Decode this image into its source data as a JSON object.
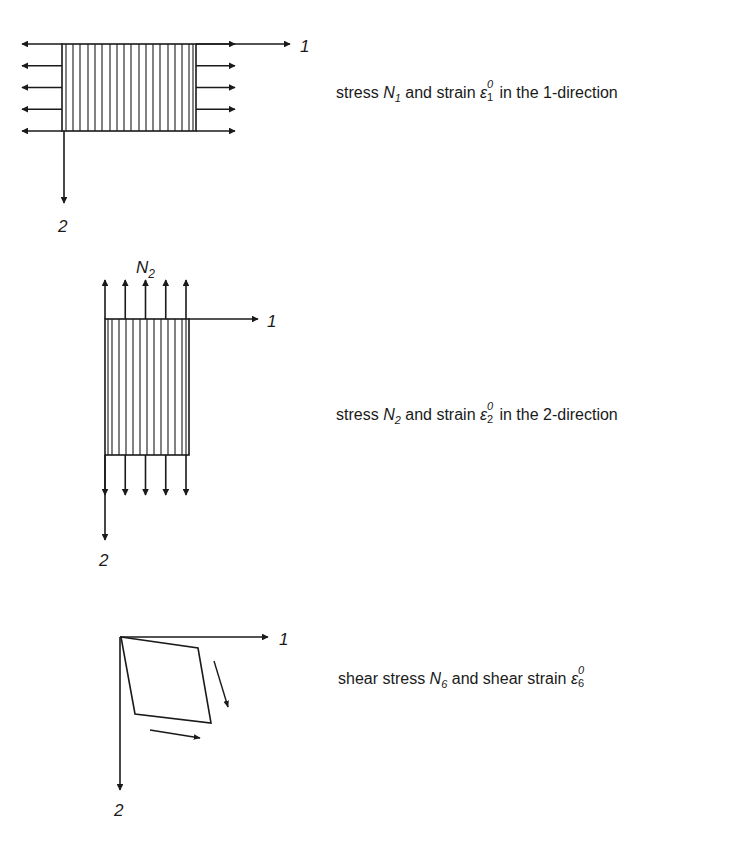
{
  "colors": {
    "ink": "#1a1a1a",
    "background": "#ffffff"
  },
  "panels": [
    {
      "id": "normal-1",
      "axis_labels": {
        "x": "1",
        "y": "2"
      },
      "hatch_direction": "vertical",
      "force_arrows": {
        "count_per_side": 5,
        "direction": "horizontal"
      },
      "caption": {
        "prefix": "stress ",
        "symbol": "N",
        "symbol_sub": "1",
        "middle": " and strain ",
        "strain_symbol": "ε",
        "strain_sup": "0",
        "strain_sub": "1",
        "suffix": " in the 1-direction"
      }
    },
    {
      "id": "normal-2",
      "axis_labels": {
        "x": "1",
        "y": "2"
      },
      "top_label": {
        "symbol": "N",
        "sub": "2"
      },
      "hatch_direction": "vertical",
      "force_arrows": {
        "count_per_side": 5,
        "direction": "vertical"
      },
      "caption": {
        "prefix": "stress ",
        "symbol": "N",
        "symbol_sub": "2",
        "middle": " and strain ",
        "strain_symbol": "ε",
        "strain_sup": "0",
        "strain_sub": "2",
        "suffix": " in the 2-direction"
      }
    },
    {
      "id": "shear-6",
      "axis_labels": {
        "x": "1",
        "y": "2"
      },
      "shape": "parallelogram",
      "shear_arrows": 2,
      "caption": {
        "prefix": "shear stress ",
        "symbol": "N",
        "symbol_sub": "6",
        "middle": " and shear strain ",
        "strain_symbol": "ε",
        "strain_sup": "0",
        "strain_sub": "6",
        "suffix": ""
      }
    }
  ]
}
